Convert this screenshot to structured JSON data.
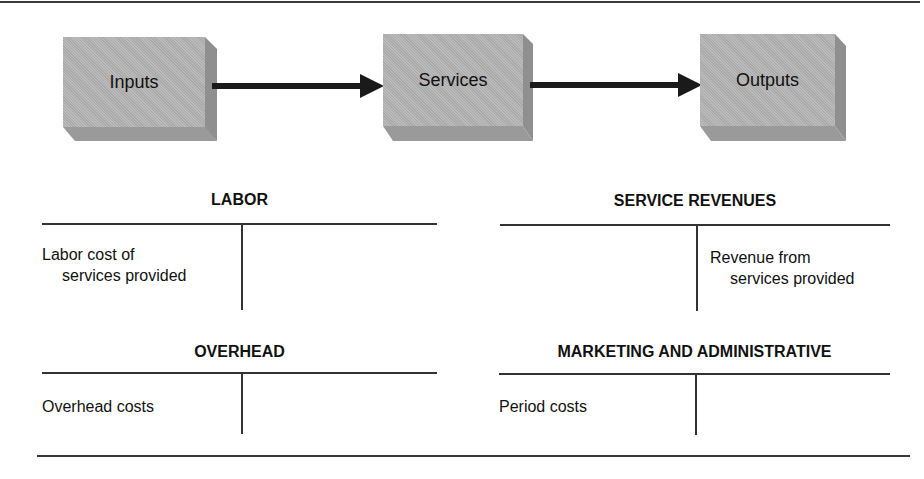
{
  "flow": {
    "boxes": [
      {
        "id": "inputs",
        "label": "Inputs"
      },
      {
        "id": "services",
        "label": "Services"
      },
      {
        "id": "outputs",
        "label": "Outputs"
      }
    ],
    "arrows": [
      {
        "from": "Inputs",
        "to": "Services"
      },
      {
        "from": "Services",
        "to": "Outputs"
      }
    ],
    "colors": {
      "box_face": "#b3b3b3",
      "box_side": "#8f8f8f",
      "box_bottom": "#999999",
      "arrow": "#1a1a1a"
    }
  },
  "accounts": [
    {
      "title": "LABOR",
      "debit": [
        "Labor cost of",
        "services provided"
      ],
      "credit": []
    },
    {
      "title": "SERVICE REVENUES",
      "debit": [],
      "credit": [
        "Revenue from",
        "services provided"
      ]
    },
    {
      "title": "OVERHEAD",
      "debit": [
        "Overhead costs"
      ],
      "credit": []
    },
    {
      "title": "MARKETING AND ADMINISTRATIVE",
      "debit": [
        "Period costs"
      ],
      "credit": []
    }
  ]
}
